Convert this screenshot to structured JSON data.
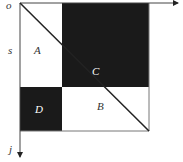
{
  "diagram": {
    "origin_label": "o",
    "row_axis_label": "s",
    "col_axis_label": "j",
    "regions": [
      {
        "label": "A",
        "fill": "#ffffff",
        "text_color": "#333333"
      },
      {
        "label": "B",
        "fill": "#ffffff",
        "text_color": "#333333"
      },
      {
        "label": "C",
        "fill": "#1a1a1a",
        "text_color": "#ffffff"
      },
      {
        "label": "D",
        "fill": "#1a1a1a",
        "text_color": "#ffffff"
      }
    ]
  }
}
